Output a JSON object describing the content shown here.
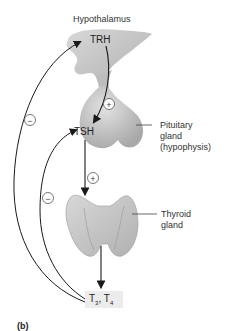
{
  "labels": {
    "hypothalamus": "Hypothalamus",
    "pituitary_line1": "Pituitary",
    "pituitary_line2": "gland",
    "pituitary_line3": "(hypophysis)",
    "thyroid_line1": "Thyroid",
    "thyroid_line2": "gland",
    "panel": "(b)"
  },
  "hormones": {
    "trh": "TRH",
    "tsh": "TSH",
    "t3_base": "T",
    "t3_sub": "3",
    "sep": ", T",
    "t4_sub": "4"
  },
  "signs": {
    "stimulate": "+",
    "inhibit": "−"
  },
  "colors": {
    "organ_fill": "#c8c8c8",
    "organ_shadow": "#a9a9a9",
    "arrow": "#1a1a1a",
    "box_fill": "#ececec"
  }
}
